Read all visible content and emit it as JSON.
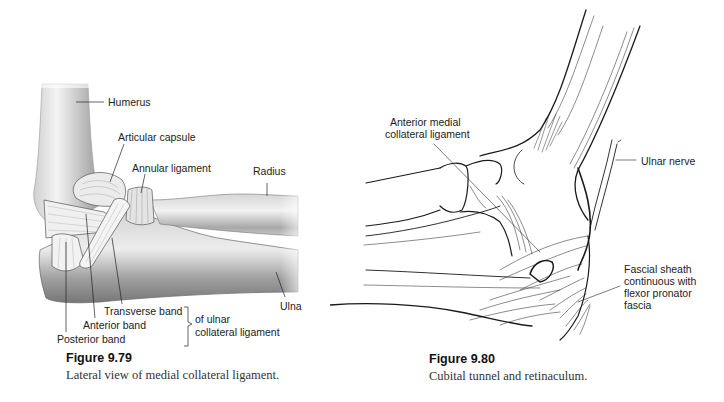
{
  "figures": [
    {
      "id": "9.79",
      "caption_title": "Figure 9.79",
      "caption_text": "Lateral view of medial collateral ligament.",
      "labels": {
        "humerus": "Humerus",
        "articular_capsule": "Articular capsule",
        "annular_ligament": "Annular ligament",
        "radius": "Radius",
        "ulna": "Ulna",
        "transverse_band": "Transverse band",
        "anterior_band": "Anterior band",
        "posterior_band": "Posterior band",
        "group_label_line1": "of ulnar",
        "group_label_line2": "collateral ligament"
      }
    },
    {
      "id": "9.80",
      "caption_title": "Figure 9.80",
      "caption_text": "Cubital tunnel and retinaculum.",
      "labels": {
        "anterior_mcl_line1": "Anterior medial",
        "anterior_mcl_line2": "collateral ligament",
        "ulnar_nerve": "Ulnar nerve",
        "fascial_line1": "Fascial sheath",
        "fascial_line2": "continuous with",
        "fascial_line3": "flexor pronator",
        "fascial_line4": "fascia"
      }
    }
  ],
  "colors": {
    "background": "#ffffff",
    "text": "#222222",
    "bone_light": "#e8e8e8",
    "bone_mid": "#bdbdbd",
    "bone_dark": "#8a8a8a",
    "line_art": "#1a1a1a"
  }
}
